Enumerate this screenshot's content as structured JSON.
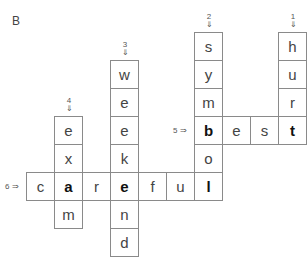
{
  "section_label": "B",
  "cell_size": 28,
  "origin": {
    "x": 27,
    "y": 33
  },
  "clues": {
    "down": [
      {
        "number": "1",
        "arrow": "⇓",
        "word": "hurt",
        "col": 9,
        "row": 0
      },
      {
        "number": "2",
        "arrow": "⇓",
        "word": "symbol",
        "col": 6,
        "row": 0
      },
      {
        "number": "3",
        "arrow": "⇓",
        "word": "weekend",
        "col": 3,
        "row": 1
      },
      {
        "number": "4",
        "arrow": "⇓",
        "word": "exam",
        "col": 1,
        "row": 3
      }
    ],
    "across": [
      {
        "number": "5",
        "arrow": "⇒",
        "word": "best",
        "col": 6,
        "row": 3
      },
      {
        "number": "6",
        "arrow": "⇒",
        "word": "careful",
        "col": 0,
        "row": 5
      }
    ]
  },
  "cells": [
    {
      "letter": "h",
      "col": 9,
      "row": 0,
      "bold": false
    },
    {
      "letter": "u",
      "col": 9,
      "row": 1,
      "bold": false
    },
    {
      "letter": "r",
      "col": 9,
      "row": 2,
      "bold": false
    },
    {
      "letter": "t",
      "col": 9,
      "row": 3,
      "bold": true
    },
    {
      "letter": "s",
      "col": 6,
      "row": 0,
      "bold": false
    },
    {
      "letter": "y",
      "col": 6,
      "row": 1,
      "bold": false
    },
    {
      "letter": "m",
      "col": 6,
      "row": 2,
      "bold": false
    },
    {
      "letter": "b",
      "col": 6,
      "row": 3,
      "bold": true
    },
    {
      "letter": "o",
      "col": 6,
      "row": 4,
      "bold": false
    },
    {
      "letter": "l",
      "col": 6,
      "row": 5,
      "bold": true
    },
    {
      "letter": "e",
      "col": 7,
      "row": 3,
      "bold": false
    },
    {
      "letter": "s",
      "col": 8,
      "row": 3,
      "bold": false
    },
    {
      "letter": "w",
      "col": 3,
      "row": 1,
      "bold": false
    },
    {
      "letter": "e",
      "col": 3,
      "row": 2,
      "bold": false
    },
    {
      "letter": "e",
      "col": 3,
      "row": 3,
      "bold": false
    },
    {
      "letter": "k",
      "col": 3,
      "row": 4,
      "bold": false
    },
    {
      "letter": "e",
      "col": 3,
      "row": 5,
      "bold": true
    },
    {
      "letter": "n",
      "col": 3,
      "row": 6,
      "bold": false
    },
    {
      "letter": "d",
      "col": 3,
      "row": 7,
      "bold": false
    },
    {
      "letter": "e",
      "col": 1,
      "row": 3,
      "bold": false
    },
    {
      "letter": "x",
      "col": 1,
      "row": 4,
      "bold": false
    },
    {
      "letter": "a",
      "col": 1,
      "row": 5,
      "bold": true
    },
    {
      "letter": "m",
      "col": 1,
      "row": 6,
      "bold": false
    },
    {
      "letter": "c",
      "col": 0,
      "row": 5,
      "bold": false
    },
    {
      "letter": "r",
      "col": 2,
      "row": 5,
      "bold": false
    },
    {
      "letter": "f",
      "col": 4,
      "row": 5,
      "bold": false
    },
    {
      "letter": "u",
      "col": 5,
      "row": 5,
      "bold": false
    }
  ]
}
